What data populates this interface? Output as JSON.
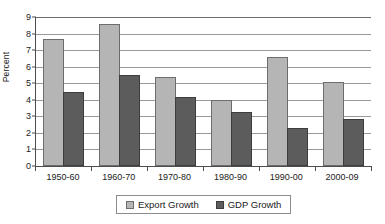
{
  "chart_data": {
    "type": "bar",
    "title": "",
    "subtitle": "",
    "xlabel": "",
    "ylabel": "Percent",
    "ylim": [
      0,
      9
    ],
    "ytick_interval": 1,
    "yticks": [
      0,
      1,
      2,
      3,
      4,
      5,
      6,
      7,
      8,
      9
    ],
    "ytick_labels": [
      "0",
      "1",
      "2",
      "3",
      "4",
      "5",
      "6",
      "7",
      "8",
      "9"
    ],
    "grid": "horizontal",
    "legend_position": "bottom-center",
    "categories": [
      "1950-60",
      "1960-70",
      "1970-80",
      "1980-90",
      "1990-00",
      "2000-09"
    ],
    "series": [
      {
        "name": "Export Growth",
        "color": "#b5b5b5",
        "values": [
          7.7,
          8.6,
          5.35,
          4.0,
          6.6,
          5.1
        ]
      },
      {
        "name": "GDP Growth",
        "color": "#5c5c5c",
        "values": [
          4.5,
          5.5,
          4.15,
          3.25,
          2.3,
          2.85
        ]
      }
    ],
    "annotations": []
  },
  "legend": {
    "items": [
      {
        "label": "Export Growth"
      },
      {
        "label": "GDP Growth"
      }
    ]
  },
  "colors": {
    "export_growth": "#b5b5b5",
    "gdp_growth": "#5c5c5c",
    "axis": "#4d4d4d",
    "gridline": "#9a9a9a",
    "background": "#ffffff"
  }
}
